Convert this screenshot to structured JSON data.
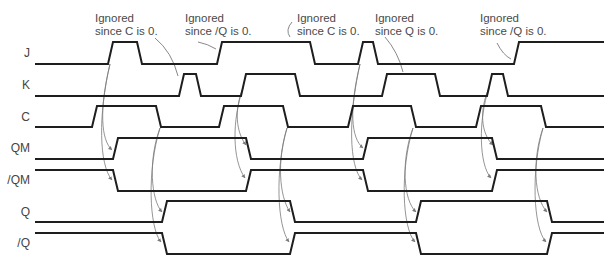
{
  "diagram": {
    "type": "timing-diagram",
    "x_start": 35,
    "x_end": 604,
    "ramp_width": 5,
    "signals": [
      {
        "label": "J",
        "label_y": 53,
        "high_y": 42,
        "low_y": 64,
        "initial": "L",
        "transitions": [
          [
            108,
            "H"
          ],
          [
            137,
            "L"
          ],
          [
            217,
            "H"
          ],
          [
            310,
            "L"
          ],
          [
            358,
            "H"
          ],
          [
            373,
            "L"
          ],
          [
            514,
            "H"
          ]
        ]
      },
      {
        "label": "K",
        "label_y": 85,
        "high_y": 74,
        "low_y": 96,
        "initial": "L",
        "transitions": [
          [
            179,
            "H"
          ],
          [
            196,
            "L"
          ],
          [
            241,
            "H"
          ],
          [
            295,
            "L"
          ],
          [
            382,
            "H"
          ],
          [
            435,
            "L"
          ],
          [
            487,
            "H"
          ],
          [
            503,
            "L"
          ]
        ]
      },
      {
        "label": "C",
        "label_y": 117,
        "high_y": 106,
        "low_y": 127,
        "initial": "L",
        "transitions": [
          [
            92,
            "H"
          ],
          [
            156,
            "L"
          ],
          [
            219,
            "H"
          ],
          [
            283,
            "L"
          ],
          [
            348,
            "H"
          ],
          [
            411,
            "L"
          ],
          [
            476,
            "H"
          ],
          [
            541,
            "L"
          ]
        ]
      },
      {
        "label": "QM",
        "label_y": 148,
        "high_y": 138,
        "low_y": 159,
        "initial": "L",
        "transitions": [
          [
            113,
            "H"
          ],
          [
            246,
            "L"
          ],
          [
            363,
            "H"
          ],
          [
            492,
            "L"
          ]
        ]
      },
      {
        "label": "/QM",
        "label_y": 180,
        "high_y": 170,
        "low_y": 191,
        "initial": "H",
        "transitions": [
          [
            113,
            "L"
          ],
          [
            246,
            "H"
          ],
          [
            363,
            "L"
          ],
          [
            492,
            "H"
          ]
        ]
      },
      {
        "label": "Q",
        "label_y": 212,
        "high_y": 201,
        "low_y": 222,
        "initial": "L",
        "transitions": [
          [
            162,
            "H"
          ],
          [
            290,
            "L"
          ],
          [
            416,
            "H"
          ],
          [
            547,
            "L"
          ]
        ]
      },
      {
        "label": "/Q",
        "label_y": 243,
        "high_y": 233,
        "low_y": 254,
        "initial": "H",
        "transitions": [
          [
            162,
            "L"
          ],
          [
            290,
            "H"
          ],
          [
            416,
            "L"
          ],
          [
            547,
            "H"
          ]
        ]
      }
    ],
    "annotations": [
      {
        "line1": "Ignored",
        "line2": "since C is 0.",
        "x": 95,
        "y": 12,
        "pointer": "M155,38 Q172,52 178,76"
      },
      {
        "line1": "Ignored",
        "line2": "since /Q is 0.",
        "x": 185,
        "y": 12,
        "pointer": "M198,42 Q208,44 216,49"
      },
      {
        "line1": "Ignored",
        "line2": "since C is 0.",
        "x": 297,
        "y": 12,
        "pointer": "M292,22 Q285,30 290,37"
      },
      {
        "line1": "Ignored",
        "line2": "since Q is 0.",
        "x": 375,
        "y": 12,
        "pointer": "M385,37 Q398,52 403,72"
      },
      {
        "line1": "Ignored",
        "line2": "since /Q is 0.",
        "x": 480,
        "y": 12,
        "pointer": "M497,43 Q503,55 511,59"
      }
    ],
    "causal_arrows": [
      "M110,64 C99,110 101,140 112,150",
      "M110,64 C98,115 99,165 112,180",
      "M160,128 C148,160 151,200 162,212",
      "M160,128 C147,170 149,228 161,242",
      "M243,88 C234,110 236,132 246,145",
      "M243,88 C232,120 232,160 245,178",
      "M287,128 C277,160 279,196 290,212",
      "M287,128 C275,170 277,226 289,242",
      "M360,64 C349,110 351,138 363,148",
      "M360,64 C348,118 349,166 362,180",
      "M413,128 C401,160 403,200 416,212",
      "M413,128 C400,170 402,228 415,242",
      "M489,88 C479,110 481,134 493,145",
      "M489,88 C478,120 479,165 491,178",
      "M543,128 C532,160 534,198 547,212",
      "M543,128 C531,170 533,228 546,242"
    ]
  },
  "colors": {
    "waveform": "#1e1e1e",
    "arrow": "#7a7a7a",
    "label_text": "#444444",
    "annotation_text": "#4a4a4a",
    "background": "#ffffff"
  }
}
